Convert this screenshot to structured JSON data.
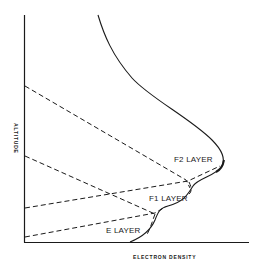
{
  "diagram": {
    "axes": {
      "x_label": "ELECTRON DENSITY",
      "y_label": "ALTITUDE"
    },
    "layers": [
      {
        "label": "F2 LAYER"
      },
      {
        "label": "F1 LAYER"
      },
      {
        "label": "E LAYER"
      }
    ],
    "colors": {
      "ink": "#1a1a1a",
      "background": "#ffffff"
    }
  }
}
